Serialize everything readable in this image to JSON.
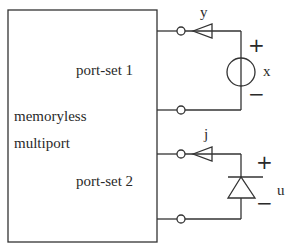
{
  "block": {
    "title_line1": "memoryless",
    "title_line2": "multiport",
    "port_set_1": "port-set 1",
    "port_set_2": "port-set 2"
  },
  "port1": {
    "current_label": "y",
    "voltage_label": "x",
    "plus": "+",
    "minus": "−",
    "element": "voltage-source"
  },
  "port2": {
    "current_label": "j",
    "voltage_label": "u",
    "plus": "+",
    "minus": "−",
    "element": "diode"
  },
  "colors": {
    "line": "#333333",
    "background": "#ffffff"
  }
}
